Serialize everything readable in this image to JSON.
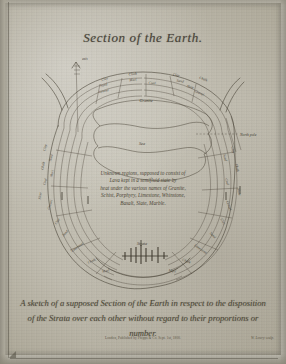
{
  "plate": {
    "title": "Section of the Earth.",
    "caption_line_1": "A sketch of a supposed Section of the Earth in respect to the disposition",
    "caption_line_2": "of the Strata over each other without regard to their proportions or number.",
    "imprint": "London, Published by Phipps & Co. Sept. 1st, 1800.",
    "engraver": "W. Lowry sculp."
  },
  "core_note": {
    "line_1": "Unknown regions, supposed to consist of",
    "line_2": "Lava kept in a semifluid state by",
    "line_3": "heat under the various names of Granite,",
    "line_4": "Schist, Porphyry, Limestone, Whinstone,",
    "line_5": "Basalt, Slate, Marble."
  },
  "diagram": {
    "axis_label": "axis",
    "pole_label": "North pole",
    "inner_labels": [
      {
        "text": "Granite",
        "x": 146,
        "y": 102
      },
      {
        "text": "Sea",
        "x": 142,
        "y": 145
      },
      {
        "text": "Strata",
        "x": 142,
        "y": 245
      }
    ],
    "strata_labels_top": [
      {
        "text": "Clay",
        "x": 105,
        "y": 80,
        "rot": -16
      },
      {
        "text": "Sand",
        "x": 104,
        "y": 86,
        "rot": -14
      },
      {
        "text": "Gravel",
        "x": 104,
        "y": 92,
        "rot": -12
      },
      {
        "text": "Chalk",
        "x": 133,
        "y": 75,
        "rot": -6
      },
      {
        "text": "Marl",
        "x": 133,
        "y": 81,
        "rot": -5
      },
      {
        "text": "Coal",
        "x": 152,
        "y": 84,
        "rot": 4
      },
      {
        "text": "Clay",
        "x": 176,
        "y": 76,
        "rot": 10
      },
      {
        "text": "Sand",
        "x": 180,
        "y": 82,
        "rot": 12
      },
      {
        "text": "Slate",
        "x": 190,
        "y": 88,
        "rot": 16
      },
      {
        "text": "Chalk",
        "x": 203,
        "y": 80,
        "rot": 20
      },
      {
        "text": "Gravel",
        "x": 199,
        "y": 94,
        "rot": 24
      }
    ],
    "strata_labels_left": [
      {
        "text": "Clay",
        "x": 46,
        "y": 148,
        "rot": -76
      },
      {
        "text": "Sand",
        "x": 52,
        "y": 158,
        "rot": -74
      },
      {
        "text": "Chalk",
        "x": 44,
        "y": 166,
        "rot": -78
      },
      {
        "text": "Marl",
        "x": 53,
        "y": 174,
        "rot": -74
      },
      {
        "text": "Coal",
        "x": 46,
        "y": 182,
        "rot": -76
      },
      {
        "text": "Slate",
        "x": 41,
        "y": 196,
        "rot": -80
      },
      {
        "text": "Gravel",
        "x": 51,
        "y": 205,
        "rot": -72
      },
      {
        "text": "Clay",
        "x": 58,
        "y": 222,
        "rot": -58
      },
      {
        "text": "Sand",
        "x": 66,
        "y": 234,
        "rot": -48
      },
      {
        "text": "Limestone",
        "x": 78,
        "y": 248,
        "rot": -36
      },
      {
        "text": "Chalk",
        "x": 92,
        "y": 262,
        "rot": -24
      },
      {
        "text": "Marl",
        "x": 106,
        "y": 272,
        "rot": -14
      }
    ],
    "strata_labels_right": [
      {
        "text": "Clay",
        "x": 232,
        "y": 150,
        "rot": 78
      },
      {
        "text": "Sand",
        "x": 224,
        "y": 158,
        "rot": 76
      },
      {
        "text": "Chalk",
        "x": 236,
        "y": 168,
        "rot": 80
      },
      {
        "text": "Coal",
        "x": 226,
        "y": 182,
        "rot": 74
      },
      {
        "text": "Slate",
        "x": 238,
        "y": 192,
        "rot": 78
      },
      {
        "text": "Gravel",
        "x": 228,
        "y": 206,
        "rot": 70
      },
      {
        "text": "Clay",
        "x": 222,
        "y": 222,
        "rot": 58
      },
      {
        "text": "Sand",
        "x": 212,
        "y": 236,
        "rot": 46
      },
      {
        "text": "Limestone",
        "x": 200,
        "y": 250,
        "rot": 34
      },
      {
        "text": "Chalk",
        "x": 186,
        "y": 262,
        "rot": 22
      },
      {
        "text": "Marl",
        "x": 172,
        "y": 272,
        "rot": 12
      }
    ]
  }
}
